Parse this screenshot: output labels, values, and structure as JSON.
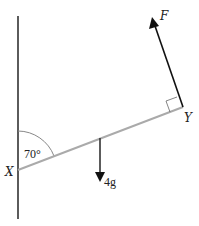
{
  "diagram": {
    "type": "mechanics-force-diagram",
    "wall": {
      "x": 18,
      "y_top": 16,
      "y_bottom": 219,
      "color": "#333333"
    },
    "rod": {
      "from": "X",
      "to": "Y",
      "color": "#aaaaaa"
    },
    "points": {
      "X": {
        "label": "X",
        "x": 18,
        "y": 170
      },
      "Y": {
        "label": "Y",
        "x": 183,
        "y": 107
      }
    },
    "angle": {
      "label": "70°",
      "value_deg": 70,
      "at": "X",
      "between": [
        "wall",
        "rod"
      ]
    },
    "forces": [
      {
        "name": "F",
        "label": "F",
        "from": [
          183,
          107
        ],
        "to": [
          152,
          18
        ],
        "perpendicular_to_rod": true,
        "color": "#111111"
      },
      {
        "name": "weight",
        "label": "4g",
        "from": [
          100,
          138
        ],
        "to": [
          100,
          182
        ],
        "color": "#333333"
      }
    ],
    "right_angle_marker": {
      "at": "Y"
    }
  }
}
